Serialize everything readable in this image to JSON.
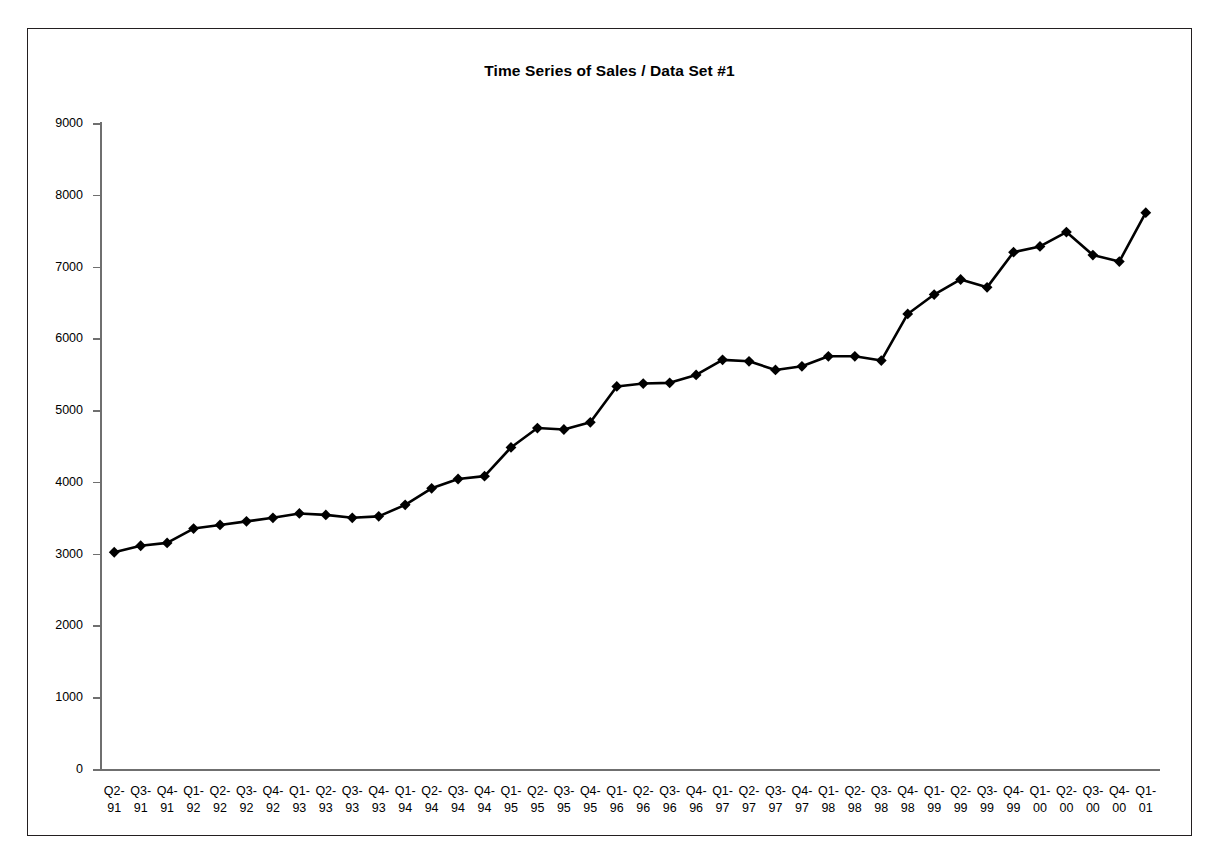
{
  "chart_data": {
    "type": "line",
    "title": "Time Series of Sales / Data Set #1",
    "xlabel": "",
    "ylabel": "",
    "ylim": [
      0,
      9000
    ],
    "ytick_step": 1000,
    "yticks": [
      0,
      1000,
      2000,
      3000,
      4000,
      5000,
      6000,
      7000,
      8000,
      9000
    ],
    "grid": false,
    "legend": false,
    "marker": "diamond",
    "line_color": "#000000",
    "marker_color": "#000000",
    "categories": [
      "Q2-91",
      "Q3-91",
      "Q4-91",
      "Q1-92",
      "Q2-92",
      "Q3-92",
      "Q4-92",
      "Q1-93",
      "Q2-93",
      "Q3-93",
      "Q4-93",
      "Q1-94",
      "Q2-94",
      "Q3-94",
      "Q4-94",
      "Q1-95",
      "Q2-95",
      "Q3-95",
      "Q4-95",
      "Q1-96",
      "Q2-96",
      "Q3-96",
      "Q4-96",
      "Q1-97",
      "Q2-97",
      "Q3-97",
      "Q4-97",
      "Q1-98",
      "Q2-98",
      "Q3-98",
      "Q4-98",
      "Q1-99",
      "Q2-99",
      "Q3-99",
      "Q4-99",
      "Q1-00",
      "Q2-00",
      "Q3-00",
      "Q4-00",
      "Q1-01"
    ],
    "category_lines": [
      [
        "Q2-",
        "91"
      ],
      [
        "Q3-",
        "91"
      ],
      [
        "Q4-",
        "91"
      ],
      [
        "Q1-",
        "92"
      ],
      [
        "Q2-",
        "92"
      ],
      [
        "Q3-",
        "92"
      ],
      [
        "Q4-",
        "92"
      ],
      [
        "Q1-",
        "93"
      ],
      [
        "Q2-",
        "93"
      ],
      [
        "Q3-",
        "93"
      ],
      [
        "Q4-",
        "93"
      ],
      [
        "Q1-",
        "94"
      ],
      [
        "Q2-",
        "94"
      ],
      [
        "Q3-",
        "94"
      ],
      [
        "Q4-",
        "94"
      ],
      [
        "Q1-",
        "95"
      ],
      [
        "Q2-",
        "95"
      ],
      [
        "Q3-",
        "95"
      ],
      [
        "Q4-",
        "95"
      ],
      [
        "Q1-",
        "96"
      ],
      [
        "Q2-",
        "96"
      ],
      [
        "Q3-",
        "96"
      ],
      [
        "Q4-",
        "96"
      ],
      [
        "Q1-",
        "97"
      ],
      [
        "Q2-",
        "97"
      ],
      [
        "Q3-",
        "97"
      ],
      [
        "Q4-",
        "97"
      ],
      [
        "Q1-",
        "98"
      ],
      [
        "Q2-",
        "98"
      ],
      [
        "Q3-",
        "98"
      ],
      [
        "Q4-",
        "98"
      ],
      [
        "Q1-",
        "99"
      ],
      [
        "Q2-",
        "99"
      ],
      [
        "Q3-",
        "99"
      ],
      [
        "Q4-",
        "99"
      ],
      [
        "Q1-",
        "00"
      ],
      [
        "Q2-",
        "00"
      ],
      [
        "Q3-",
        "00"
      ],
      [
        "Q4-",
        "00"
      ],
      [
        "Q1-",
        "01"
      ]
    ],
    "values": [
      3020,
      3110,
      3150,
      3350,
      3400,
      3450,
      3500,
      3560,
      3540,
      3500,
      3520,
      3680,
      3910,
      4040,
      4080,
      4480,
      4750,
      4730,
      4830,
      5330,
      5370,
      5380,
      5490,
      5700,
      5680,
      5560,
      5610,
      5750,
      5750,
      5690,
      6340,
      6610,
      6820,
      6710,
      7200,
      7280,
      7480,
      7160,
      7070,
      7750
    ],
    "series": [
      {
        "name": "Data Set #1",
        "values": [
          3020,
          3110,
          3150,
          3350,
          3400,
          3450,
          3500,
          3560,
          3540,
          3500,
          3520,
          3680,
          3910,
          4040,
          4080,
          4480,
          4750,
          4730,
          4830,
          5330,
          5370,
          5380,
          5490,
          5700,
          5680,
          5560,
          5610,
          5750,
          5750,
          5690,
          6340,
          6610,
          6820,
          6710,
          7200,
          7280,
          7480,
          7160,
          7070,
          7750
        ]
      }
    ]
  }
}
